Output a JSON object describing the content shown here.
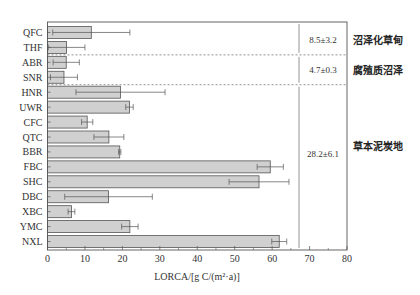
{
  "chart_data": {
    "type": "bar",
    "orientation": "horizontal",
    "title": "",
    "xlabel": "LORCA/[g C/(m²·a)]",
    "ylabel": "",
    "xlim": [
      0,
      80
    ],
    "xticks": [
      0,
      10,
      20,
      30,
      40,
      50,
      60,
      70,
      80
    ],
    "grid": false,
    "legend": null,
    "categories": [
      "QFC",
      "THF",
      "ABR",
      "SNR",
      "HNR",
      "UWR",
      "CFC",
      "QTC",
      "BBR",
      "FBC",
      "SHC",
      "DBC",
      "XBC",
      "YMC",
      "NXL"
    ],
    "values": [
      11.7,
      5.1,
      5.0,
      4.4,
      19.5,
      21.9,
      10.6,
      16.4,
      19.3,
      59.5,
      56.5,
      16.3,
      6.4,
      22.0,
      61.9
    ],
    "error": [
      10.3,
      4.9,
      3.5,
      3.6,
      11.9,
      1.0,
      1.5,
      4.0,
      0.3,
      3.5,
      8.0,
      11.7,
      0.9,
      2.2,
      2.0
    ],
    "groups": [
      {
        "name": "沼泽化草甸",
        "members": [
          "QFC",
          "THF"
        ],
        "mean_label": "8.5±3.2"
      },
      {
        "name": "腐殖质沼泽",
        "members": [
          "ABR",
          "SNR"
        ],
        "mean_label": "4.7±0.3"
      },
      {
        "name": "草本泥炭地",
        "members": [
          "HNR",
          "UWR",
          "CFC",
          "QTC",
          "BBR",
          "FBC",
          "SHC",
          "DBC",
          "XBC",
          "YMC",
          "NXL"
        ],
        "mean_label": "28.2±6.1"
      }
    ],
    "colors": {
      "bar_fill": "#d0d0d0",
      "bar_edge": "#555555",
      "axis": "#555555",
      "divider": "#888888"
    }
  }
}
